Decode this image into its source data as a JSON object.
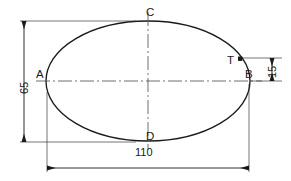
{
  "drawing": {
    "type": "engineering-dimensioned-ellipse",
    "background_color": "#ffffff",
    "line_color": "#1a1a1a",
    "shape": {
      "name": "ellipse",
      "center": {
        "x": 148,
        "y": 81
      },
      "semi_major_x": 102,
      "semi_minor_y": 60
    },
    "point_labels": [
      {
        "id": "A",
        "text": "A",
        "position": "left-vertex",
        "x": 37,
        "y": 75
      },
      {
        "id": "B",
        "text": "B",
        "position": "right-vertex",
        "x": 245,
        "y": 75
      },
      {
        "id": "C",
        "text": "C",
        "position": "top-vertex",
        "x": 148,
        "y": 8
      },
      {
        "id": "D",
        "text": "D",
        "position": "bottom-vertex",
        "x": 148,
        "y": 134
      },
      {
        "id": "T",
        "text": "T",
        "position": "upper-right-arc-tangent-point",
        "x": 228,
        "y": 56
      }
    ],
    "marker_point": {
      "id": "T",
      "shape": "filled-square",
      "x": 240,
      "y": 58.5,
      "size": 4
    },
    "dimensions": [
      {
        "id": "height",
        "text": "65",
        "orientation": "vertical",
        "side": "left",
        "line_x": 24,
        "from_y": 21,
        "to_y": 142,
        "label_x": 18,
        "label_y": 92
      },
      {
        "id": "width",
        "text": "110",
        "orientation": "horizontal",
        "side": "bottom",
        "line_y": 168,
        "from_x": 47,
        "to_x": 249,
        "label_x": 136,
        "label_y": 152
      },
      {
        "id": "offset",
        "text": "15",
        "orientation": "vertical",
        "side": "right",
        "line_x": 272,
        "from_y": 58,
        "to_y": 81,
        "label_x": 266,
        "label_y": 76
      }
    ],
    "centerlines": {
      "style": "dash-dot",
      "horizontal": {
        "y": 81,
        "from_x": 36,
        "to_x": 262
      },
      "vertical": {
        "x": 148,
        "from_y": 12,
        "to_y": 150
      }
    }
  }
}
